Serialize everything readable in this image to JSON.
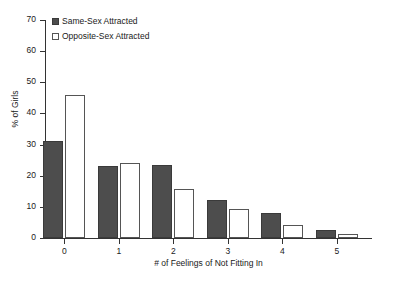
{
  "chart_data": {
    "type": "bar",
    "title": "",
    "xlabel": "# of Feelings of Not Fitting In",
    "ylabel": "% of Girls",
    "categories": [
      "0",
      "1",
      "2",
      "3",
      "4",
      "5"
    ],
    "series": [
      {
        "name": "Same-Sex Attracted",
        "color": "#4d4d4d",
        "values": [
          31,
          23,
          23.3,
          12.2,
          7.9,
          2.5
        ]
      },
      {
        "name": "Opposite-Sex Attracted",
        "color": "#ffffff",
        "values": [
          46,
          24,
          15.8,
          9.2,
          4.2,
          1.2
        ]
      }
    ],
    "ylim": [
      0,
      70
    ],
    "ytick_step": 10,
    "yticks": [
      "0",
      "10",
      "20",
      "30",
      "40",
      "50",
      "60",
      "70"
    ],
    "grid": false,
    "legend_position": "top-left"
  },
  "legend": {
    "items": [
      {
        "label": "Same-Sex Attracted",
        "swatch": "filled-dark-square"
      },
      {
        "label": "Opposite-Sex Attracted",
        "swatch": "open-white-square"
      }
    ]
  },
  "axes": {
    "y_title": "% of Girls",
    "x_title": "# of Feelings of Not Fitting In"
  },
  "caption": {
    "partial_text": ""
  }
}
